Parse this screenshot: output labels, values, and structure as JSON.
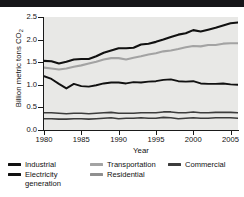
{
  "chart_data": {
    "type": "line",
    "title": "",
    "xlabel": "Year",
    "ylabel": "Billion metric tons CO2",
    "ylabel_display": "Billion metric tons CO",
    "ylabel_sub": "2",
    "xlim": [
      1980,
      2006
    ],
    "ylim": [
      0.0,
      2.5
    ],
    "ytick_labels": [
      "0.0",
      "0.5",
      "1.0",
      "1.5",
      "2.0",
      "2.5"
    ],
    "ytick_values": [
      0.0,
      0.5,
      1.0,
      1.5,
      2.0,
      2.5
    ],
    "xtick_labels": [
      "1980",
      "1985",
      "1990",
      "1995",
      "2000",
      "2005"
    ],
    "xtick_values": [
      1980,
      1985,
      1990,
      1995,
      2000,
      2005
    ],
    "grid": false,
    "legend_position": "below",
    "plot_background": "#e8e8e6",
    "x": [
      1980,
      1981,
      1982,
      1983,
      1984,
      1985,
      1986,
      1987,
      1988,
      1989,
      1990,
      1991,
      1992,
      1993,
      1994,
      1995,
      1996,
      1997,
      1998,
      1999,
      2000,
      2001,
      2002,
      2003,
      2004,
      2005,
      2006
    ],
    "series": [
      {
        "name": "Electricity generation",
        "color": "#111111",
        "width": 2.1,
        "values": [
          1.53,
          1.52,
          1.47,
          1.51,
          1.56,
          1.57,
          1.57,
          1.63,
          1.71,
          1.76,
          1.81,
          1.81,
          1.82,
          1.89,
          1.91,
          1.95,
          2.0,
          2.06,
          2.11,
          2.14,
          2.21,
          2.18,
          2.22,
          2.26,
          2.31,
          2.36,
          2.38
        ]
      },
      {
        "name": "Transportation",
        "color": "#a3a3a3",
        "width": 2.1,
        "values": [
          1.38,
          1.36,
          1.34,
          1.36,
          1.4,
          1.43,
          1.47,
          1.51,
          1.56,
          1.59,
          1.59,
          1.56,
          1.6,
          1.63,
          1.67,
          1.7,
          1.74,
          1.76,
          1.79,
          1.83,
          1.86,
          1.85,
          1.88,
          1.88,
          1.91,
          1.92,
          1.92
        ]
      },
      {
        "name": "Industrial",
        "color": "#111111",
        "width": 1.9,
        "values": [
          1.19,
          1.13,
          1.02,
          0.92,
          1.02,
          0.97,
          0.96,
          0.99,
          1.03,
          1.05,
          1.05,
          1.03,
          1.06,
          1.05,
          1.07,
          1.08,
          1.11,
          1.12,
          1.08,
          1.07,
          1.08,
          1.03,
          1.02,
          1.02,
          1.03,
          1.01,
          1.0
        ]
      },
      {
        "name": "Commercial",
        "color": "#3c3c3c",
        "width": 1.6,
        "values": [
          0.38,
          0.38,
          0.37,
          0.36,
          0.37,
          0.37,
          0.36,
          0.37,
          0.38,
          0.39,
          0.37,
          0.37,
          0.37,
          0.38,
          0.38,
          0.38,
          0.4,
          0.4,
          0.38,
          0.38,
          0.4,
          0.38,
          0.38,
          0.39,
          0.39,
          0.39,
          0.38
        ]
      },
      {
        "name": "Residential",
        "color": "#3c3c3c",
        "width": 1.6,
        "values": [
          0.25,
          0.25,
          0.24,
          0.24,
          0.25,
          0.25,
          0.24,
          0.25,
          0.26,
          0.27,
          0.25,
          0.26,
          0.26,
          0.27,
          0.26,
          0.26,
          0.28,
          0.27,
          0.25,
          0.26,
          0.27,
          0.26,
          0.26,
          0.27,
          0.27,
          0.27,
          0.26
        ]
      }
    ]
  },
  "legend": {
    "rows": [
      [
        {
          "label": "Industrial",
          "label2": "",
          "color": "#111111"
        },
        {
          "label": "Transportation",
          "label2": "",
          "color": "#a3a3a3"
        },
        {
          "label": "Commercial",
          "label2": "",
          "color": "#3c3c3c"
        }
      ],
      [
        {
          "label": "Electricity",
          "label2": "generation",
          "color": "#111111"
        },
        {
          "label": "Residential",
          "label2": "",
          "color": "#8f8f8f"
        }
      ]
    ]
  }
}
